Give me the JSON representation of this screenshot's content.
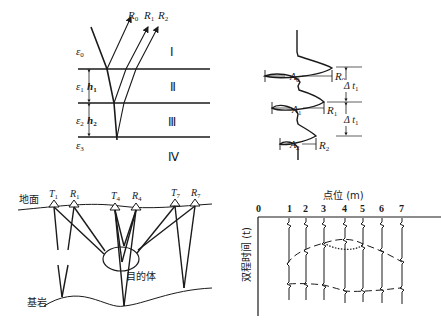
{
  "panel_a": {
    "rays": [
      "R0",
      "R1",
      "R2"
    ],
    "ray_labels": [
      {
        "main": "R",
        "sub": "0"
      },
      {
        "main": "R",
        "sub": "1"
      },
      {
        "main": "R",
        "sub": "2"
      }
    ],
    "layers": [
      "Ⅰ",
      "Ⅱ",
      "Ⅲ",
      "Ⅳ"
    ],
    "permittivities": [
      {
        "main": "ε",
        "sub": "0"
      },
      {
        "main": "ε",
        "sub": "1"
      },
      {
        "main": "ε",
        "sub": "2"
      },
      {
        "main": "ε",
        "sub": "3"
      }
    ],
    "thicknesses": [
      {
        "main": "h",
        "sub": "1"
      },
      {
        "main": "h",
        "sub": "2"
      }
    ]
  },
  "panel_b": {
    "amplitudes": [
      {
        "main": "A",
        "sub": "0"
      },
      {
        "main": "A",
        "sub": "1"
      },
      {
        "main": "A",
        "sub": "2"
      }
    ],
    "reflections": [
      {
        "main": "R",
        "sub": "0"
      },
      {
        "main": "R",
        "sub": "1"
      },
      {
        "main": "R",
        "sub": "2"
      }
    ],
    "intervals": [
      {
        "main": "Δ t",
        "sub": "1"
      },
      {
        "main": "Δ t",
        "sub": "1"
      }
    ]
  },
  "panel_c": {
    "ground_label": "地面",
    "bedrock_label": "基岩",
    "target_label": "目的体",
    "antennas": [
      {
        "main": "T",
        "sub": "1"
      },
      {
        "main": "R",
        "sub": "1"
      },
      {
        "main": "T",
        "sub": "4"
      },
      {
        "main": "R",
        "sub": "4"
      },
      {
        "main": "T",
        "sub": "7"
      },
      {
        "main": "R",
        "sub": "7"
      }
    ]
  },
  "panel_d": {
    "x_axis_title": "点位 (m)",
    "y_axis_title": "双程时间 (t)",
    "x_ticks": [
      "0",
      "1",
      "2",
      "3",
      "4",
      "5",
      "6",
      "7"
    ]
  }
}
